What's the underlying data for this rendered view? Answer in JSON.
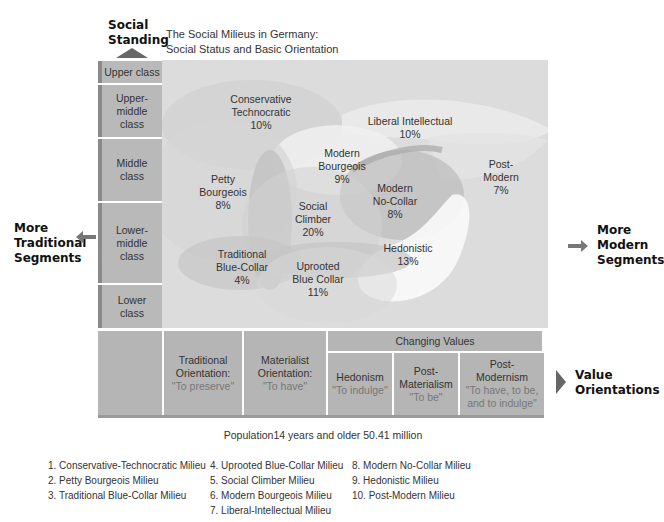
{
  "title": {
    "line1": "The Social Milieus in Germany:",
    "line2": "Social Status and Basic Orientation"
  },
  "y_axis": {
    "label_line1": "Social",
    "label_line2": "Standing",
    "classes": [
      {
        "label": "Upper class"
      },
      {
        "label_line1": "Upper-",
        "label_line2": "middle",
        "label_line3": "class"
      },
      {
        "label_line1": "Middle",
        "label_line2": "class"
      },
      {
        "label_line1": "Lower-",
        "label_line2": "middle",
        "label_line3": "class"
      },
      {
        "label_line1": "Lower",
        "label_line2": "class"
      }
    ]
  },
  "left_arrow": {
    "line1": "More",
    "line2": "Traditional",
    "line3": "Segments"
  },
  "right_arrow": {
    "line1": "More",
    "line2": "Modern",
    "line3": "Segments"
  },
  "milieus": [
    {
      "name_line1": "Conservative",
      "name_line2": "Technocratic",
      "pct": "10%"
    },
    {
      "name_line1": "Liberal Intellectual",
      "pct": "10%"
    },
    {
      "name_line1": "Modern",
      "name_line2": "Bourgeois",
      "pct": "9%"
    },
    {
      "name_line1": "Post-",
      "name_line2": "Modern",
      "pct": "7%"
    },
    {
      "name_line1": "Petty",
      "name_line2": "Bourgeois",
      "pct": "8%"
    },
    {
      "name_line1": "Modern",
      "name_line2": "No-Collar",
      "pct": "8%"
    },
    {
      "name_line1": "Social",
      "name_line2": "Climber",
      "pct": "20%"
    },
    {
      "name_line1": "Traditional",
      "name_line2": "Blue-Collar",
      "pct": "4%"
    },
    {
      "name_line1": "Uprooted",
      "name_line2": "Blue Collar",
      "pct": "11%"
    },
    {
      "name_line1": "Hedonistic",
      "pct": "13%"
    }
  ],
  "x_axis": {
    "changing_values": "Changing Values",
    "orientations": [
      {
        "line1": "Traditional",
        "line2": "Orientation:",
        "quote": "\"To preserve\""
      },
      {
        "line1": "Materialist",
        "line2": "Orientation:",
        "quote": "\"To have\""
      },
      {
        "line1": "Hedonism",
        "quote": "\"To indulge\""
      },
      {
        "line1": "Post-",
        "line2": "Materialism",
        "quote": "\"To be\""
      },
      {
        "line1": "Post-",
        "line2": "Modernism",
        "quote1": "\"To have, to be,",
        "quote2": "and to indulge\""
      }
    ],
    "label_line1": "Value",
    "label_line2": "Orientations"
  },
  "population_note": "Population14 years and older 50.41 million",
  "legend": {
    "col1": [
      "1.  Conservative-Technocratic Milieu",
      "2.  Petty Bourgeois Milieu",
      "3.  Traditional Blue-Collar Milieu"
    ],
    "col2": [
      "4.  Uprooted Blue-Collar Milieu",
      "5.  Social Climber Milieu",
      "6.  Modern Bourgeois Milieu",
      "7.  Liberal-Intellectual Milieu"
    ],
    "col3": [
      "8.  Modern No-Collar Milieu",
      "9.  Hedonistic Milieu",
      "10. Post-Modern Milieu"
    ]
  },
  "colors": {
    "plot_bg": "#dcdcdc",
    "cell_bg": "#b9b9b9",
    "cell_edge": "#8a8a8a",
    "arrow": "#666666"
  }
}
